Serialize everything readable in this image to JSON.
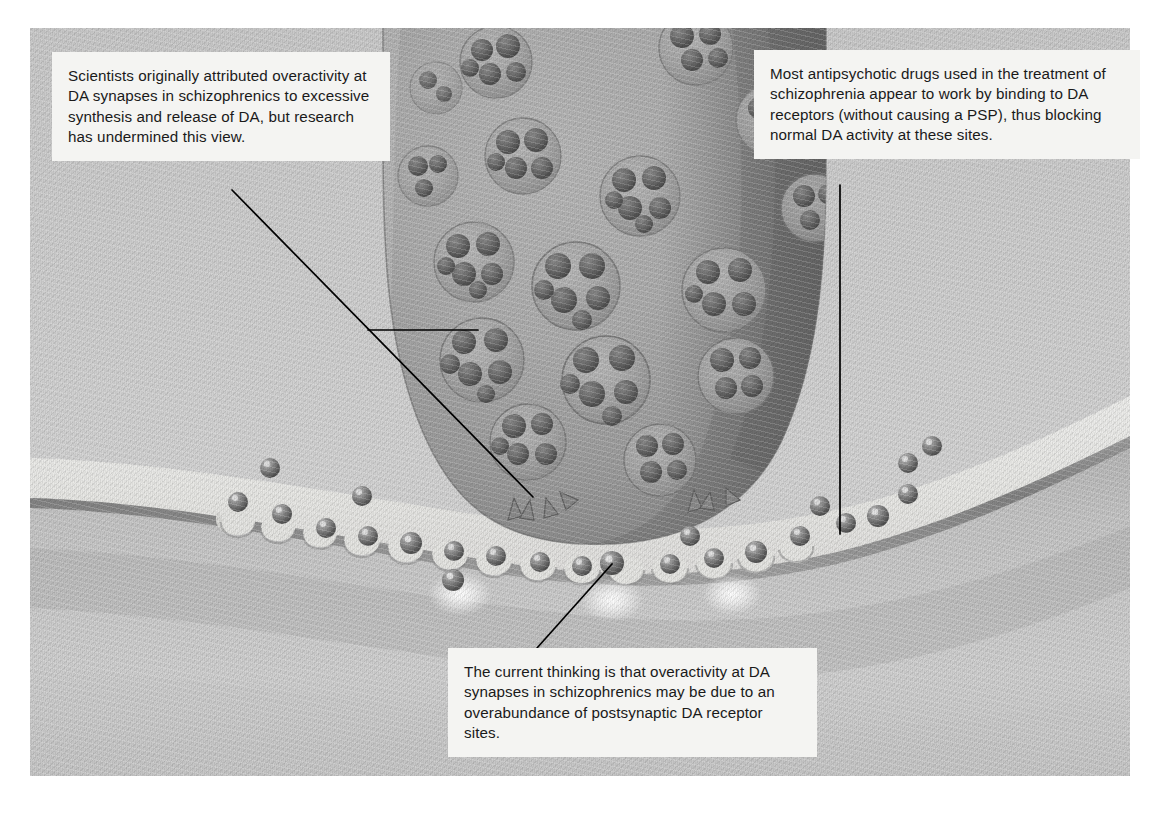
{
  "figure": {
    "kind": "scientific-illustration",
    "palette": {
      "terminal": "#a8a8a8",
      "cleft": "#e8e8e6",
      "postsynaptic": "#c2c2c2",
      "membrane": "#8c8c8c",
      "callout_bg": "#f4f4f2",
      "text": "#1a1a1a",
      "leader_line": "#000000"
    }
  },
  "callouts": {
    "left": {
      "id": "presynaptic-note",
      "text": "Scientists originally attributed overactivity at DA synapses in schizophrenics to excessive synthesis and release of DA, but research has undermined this view."
    },
    "right": {
      "id": "antipsychotic-note",
      "text": "Most antipsychotic drugs used in the treatment of schizophrenia appear to work by binding to DA receptors (without causing a PSP), thus blocking normal DA activity at these sites."
    },
    "bottom": {
      "id": "postsynaptic-note",
      "text": "The current thinking is that overactivity at DA synapses in schizophrenics may be due to an overabundance of postsynaptic DA receptor sites."
    }
  },
  "structures": {
    "presynaptic_terminal": "presynaptic-terminal",
    "synaptic_vesicles": "synaptic-vesicle",
    "synaptic_cleft": "synaptic-cleft",
    "postsynaptic_membrane": "postsynaptic-membrane",
    "receptor_sites": "da-receptor-site",
    "da_molecules": "dopamine-molecule",
    "release_sites": "vesicle-fusion-site"
  },
  "leader_lines": [
    {
      "name": "leader-left-to-vesicle",
      "from": [
        368,
        330
      ],
      "to": [
        478,
        330
      ]
    },
    {
      "name": "leader-left-to-release-site",
      "from": [
        232,
        190
      ],
      "to": [
        533,
        497
      ]
    },
    {
      "name": "leader-right-to-receptor",
      "from": [
        840,
        185
      ],
      "to": [
        840,
        534
      ]
    },
    {
      "name": "leader-bottom-to-receptor",
      "from": [
        537,
        648
      ],
      "to": [
        612,
        564
      ]
    }
  ]
}
